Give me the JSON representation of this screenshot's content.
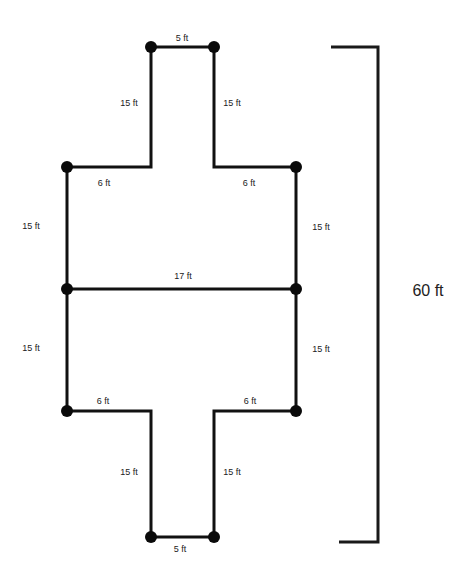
{
  "diagram": {
    "colors": {
      "line": "#111111",
      "vertex": "#0a0a0a",
      "text": "#222222",
      "background": "#ffffff"
    },
    "vertices": [
      {
        "id": "top-left",
        "x": 151,
        "y": 47
      },
      {
        "id": "top-right",
        "x": 214,
        "y": 47
      },
      {
        "id": "upper-shoulder-left",
        "x": 67,
        "y": 167
      },
      {
        "id": "upper-shoulder-right",
        "x": 296,
        "y": 167
      },
      {
        "id": "middle-left",
        "x": 67,
        "y": 289
      },
      {
        "id": "middle-right",
        "x": 296,
        "y": 289
      },
      {
        "id": "lower-shoulder-left",
        "x": 67,
        "y": 411
      },
      {
        "id": "lower-shoulder-right",
        "x": 296,
        "y": 411
      },
      {
        "id": "bottom-left",
        "x": 151,
        "y": 537
      },
      {
        "id": "bottom-right",
        "x": 214,
        "y": 537
      }
    ],
    "labels": {
      "top_width": "5 ft",
      "top_left_arm": "15 ft",
      "top_right_arm": "15 ft",
      "upper_left_shoulder": "6 ft",
      "upper_right_shoulder": "6 ft",
      "upper_left_side": "15 ft",
      "upper_right_side": "15 ft",
      "middle_width": "17 ft",
      "lower_left_side": "15 ft",
      "lower_right_side": "15 ft",
      "lower_left_shoulder": "6 ft",
      "lower_right_shoulder": "6 ft",
      "bottom_left_arm": "15 ft",
      "bottom_right_arm": "15 ft",
      "bottom_width": "5 ft",
      "total_height": "60 ft"
    }
  }
}
